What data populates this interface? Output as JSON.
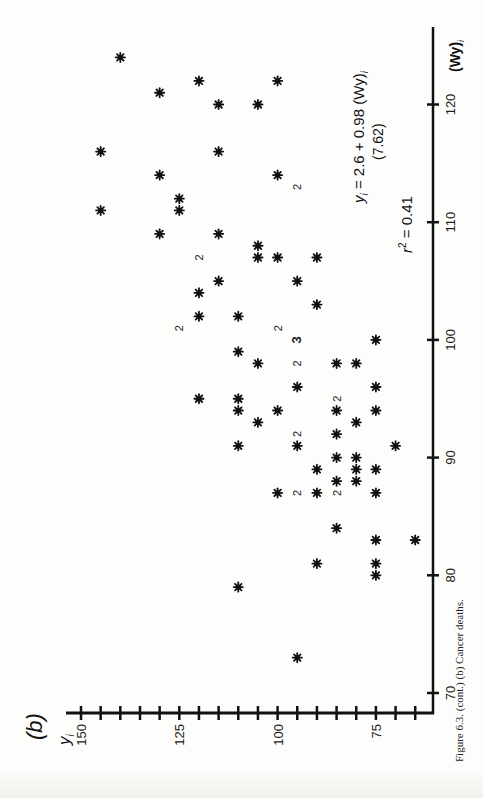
{
  "panel_label": "(b)",
  "caption": "Figure 6.3. (cont.) (b) Cancer deaths.",
  "equation": {
    "line1": "y_i = 2.6 + 0.98 (Wy)_i",
    "line1_parts": [
      "y",
      "i",
      " = 2.6 + 0.98 (Wy)",
      "i"
    ],
    "line2": "(7.62)",
    "r2_label": "r² = 0.41"
  },
  "axes": {
    "x_label": "(Wy)i",
    "y_label": "yi",
    "x_ticks": [
      70,
      80,
      90,
      100,
      110,
      120
    ],
    "y_ticks_labeled": [
      150,
      125,
      100,
      75
    ],
    "y_minor_step": 5
  },
  "chart_data": {
    "type": "scatter",
    "title": "(b) Cancer deaths",
    "xlabel": "(Wy)_i",
    "ylabel": "y_i",
    "xlim": [
      68,
      125
    ],
    "ylim": [
      64,
      152
    ],
    "orientation": "rotated 90° (x-axis vertical on right, y-axis horizontal at bottom)",
    "grid": false,
    "regression": {
      "intercept": 2.6,
      "slope": 0.98,
      "slope_t_stat": 7.62,
      "r2": 0.41
    },
    "marker": "asterisk; numerals indicate coincident points",
    "points": [
      {
        "x": 124,
        "y": 140,
        "n": 1
      },
      {
        "x": 122,
        "y": 100,
        "n": 1
      },
      {
        "x": 122,
        "y": 120,
        "n": 1
      },
      {
        "x": 121,
        "y": 130,
        "n": 1
      },
      {
        "x": 120,
        "y": 115,
        "n": 1
      },
      {
        "x": 120,
        "y": 105,
        "n": 1
      },
      {
        "x": 116,
        "y": 145,
        "n": 1
      },
      {
        "x": 116,
        "y": 115,
        "n": 1
      },
      {
        "x": 114,
        "y": 130,
        "n": 1
      },
      {
        "x": 114,
        "y": 100,
        "n": 1
      },
      {
        "x": 113,
        "y": 95,
        "n": 2
      },
      {
        "x": 112,
        "y": 125,
        "n": 1
      },
      {
        "x": 111,
        "y": 125,
        "n": 1
      },
      {
        "x": 111,
        "y": 145,
        "n": 1
      },
      {
        "x": 109,
        "y": 130,
        "n": 1
      },
      {
        "x": 109,
        "y": 115,
        "n": 1
      },
      {
        "x": 108,
        "y": 105,
        "n": 1
      },
      {
        "x": 107,
        "y": 105,
        "n": 1
      },
      {
        "x": 107,
        "y": 100,
        "n": 1
      },
      {
        "x": 107,
        "y": 90,
        "n": 1
      },
      {
        "x": 107,
        "y": 120,
        "n": 2
      },
      {
        "x": 105,
        "y": 115,
        "n": 1
      },
      {
        "x": 105,
        "y": 95,
        "n": 1
      },
      {
        "x": 104,
        "y": 120,
        "n": 1
      },
      {
        "x": 103,
        "y": 90,
        "n": 1
      },
      {
        "x": 102,
        "y": 120,
        "n": 1
      },
      {
        "x": 102,
        "y": 110,
        "n": 1
      },
      {
        "x": 101,
        "y": 125,
        "n": 2
      },
      {
        "x": 101,
        "y": 100,
        "n": 2
      },
      {
        "x": 100,
        "y": 95,
        "n": 3
      },
      {
        "x": 100,
        "y": 75,
        "n": 1
      },
      {
        "x": 99,
        "y": 110,
        "n": 1
      },
      {
        "x": 98,
        "y": 105,
        "n": 1
      },
      {
        "x": 98,
        "y": 95,
        "n": 2
      },
      {
        "x": 98,
        "y": 85,
        "n": 1
      },
      {
        "x": 98,
        "y": 80,
        "n": 1
      },
      {
        "x": 96,
        "y": 95,
        "n": 1
      },
      {
        "x": 96,
        "y": 75,
        "n": 1
      },
      {
        "x": 95,
        "y": 120,
        "n": 1
      },
      {
        "x": 95,
        "y": 110,
        "n": 1
      },
      {
        "x": 95,
        "y": 85,
        "n": 2
      },
      {
        "x": 94,
        "y": 110,
        "n": 1
      },
      {
        "x": 94,
        "y": 100,
        "n": 1
      },
      {
        "x": 94,
        "y": 85,
        "n": 1
      },
      {
        "x": 94,
        "y": 75,
        "n": 1
      },
      {
        "x": 93,
        "y": 105,
        "n": 1
      },
      {
        "x": 93,
        "y": 80,
        "n": 1
      },
      {
        "x": 92,
        "y": 95,
        "n": 2
      },
      {
        "x": 92,
        "y": 85,
        "n": 1
      },
      {
        "x": 91,
        "y": 95,
        "n": 1
      },
      {
        "x": 91,
        "y": 110,
        "n": 1
      },
      {
        "x": 91,
        "y": 70,
        "n": 1
      },
      {
        "x": 90,
        "y": 85,
        "n": 1
      },
      {
        "x": 90,
        "y": 80,
        "n": 1
      },
      {
        "x": 89,
        "y": 90,
        "n": 1
      },
      {
        "x": 89,
        "y": 80,
        "n": 1
      },
      {
        "x": 89,
        "y": 75,
        "n": 1
      },
      {
        "x": 88,
        "y": 85,
        "n": 1
      },
      {
        "x": 88,
        "y": 80,
        "n": 1
      },
      {
        "x": 87,
        "y": 100,
        "n": 1
      },
      {
        "x": 87,
        "y": 90,
        "n": 1
      },
      {
        "x": 87,
        "y": 85,
        "n": 2
      },
      {
        "x": 87,
        "y": 75,
        "n": 1
      },
      {
        "x": 87,
        "y": 95,
        "n": 2
      },
      {
        "x": 84,
        "y": 85,
        "n": 1
      },
      {
        "x": 83,
        "y": 75,
        "n": 1
      },
      {
        "x": 83,
        "y": 65,
        "n": 1
      },
      {
        "x": 81,
        "y": 90,
        "n": 1
      },
      {
        "x": 81,
        "y": 75,
        "n": 1
      },
      {
        "x": 80,
        "y": 75,
        "n": 1
      },
      {
        "x": 79,
        "y": 110,
        "n": 1
      },
      {
        "x": 73,
        "y": 95,
        "n": 1
      }
    ]
  }
}
